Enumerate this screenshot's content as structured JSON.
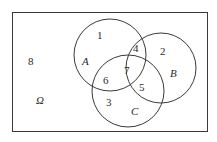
{
  "diagram": {
    "type": "venn",
    "universe": {
      "label": "Ω",
      "region_number": "8"
    },
    "sets": [
      {
        "name": "A",
        "label": "A"
      },
      {
        "name": "B",
        "label": "B"
      },
      {
        "name": "C",
        "label": "C"
      }
    ],
    "regions": [
      {
        "number": "1",
        "description": "A only"
      },
      {
        "number": "2",
        "description": "B only"
      },
      {
        "number": "3",
        "description": "C only"
      },
      {
        "number": "4",
        "description": "A and B only"
      },
      {
        "number": "5",
        "description": "B and C only"
      },
      {
        "number": "6",
        "description": "A and C only"
      },
      {
        "number": "7",
        "description": "A and B and C"
      },
      {
        "number": "8",
        "description": "outside all sets"
      }
    ],
    "colors": {
      "stroke": "#3a3a3a",
      "text": "#2a2a2a",
      "background": "#ffffff"
    }
  }
}
